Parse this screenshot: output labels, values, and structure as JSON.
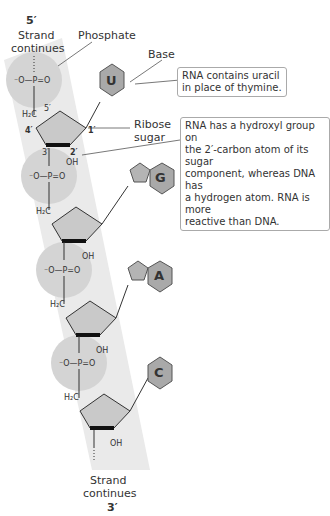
{
  "figure": {
    "top_end_label": "5′",
    "bottom_end_label": "3′",
    "strand_continues_top": [
      "Strand",
      "continues"
    ],
    "strand_continues_bottom": [
      "Strand",
      "continues"
    ]
  },
  "labels": {
    "phosphate": "Phosphate",
    "base": "Base",
    "ribose_sugar": [
      "Ribose",
      "sugar"
    ]
  },
  "callouts": {
    "uracil": [
      "RNA contains uracil",
      "in place of thymine."
    ],
    "hydroxyl": [
      "RNA has a hydroxyl group on",
      "the 2′-carbon atom of its sugar",
      "component, whereas DNA has",
      "a hydrogen atom. RNA is more",
      "reactive than DNA."
    ]
  },
  "nucleotides": [
    {
      "base": "U",
      "name": "uracil"
    },
    {
      "base": "G",
      "name": "guanine"
    },
    {
      "base": "A",
      "name": "adenine"
    },
    {
      "base": "C",
      "name": "cytosine"
    }
  ],
  "atoms": {
    "phosphate": "⁻O—P=O",
    "h2c": "H₂C",
    "c5": "5′",
    "c4": "4′",
    "c3": "3′",
    "c2": "2′",
    "c1": "1′",
    "oh": "OH",
    "o": "O",
    "h": "H"
  },
  "colors": {
    "band": "#e9e9e9",
    "phosphate_circle": "#d4d4d4",
    "sugar_fill": "#c9c9c9",
    "base_fill": "#a9a9a9",
    "callout_border": "#aaaaaa",
    "text": "#333333"
  }
}
